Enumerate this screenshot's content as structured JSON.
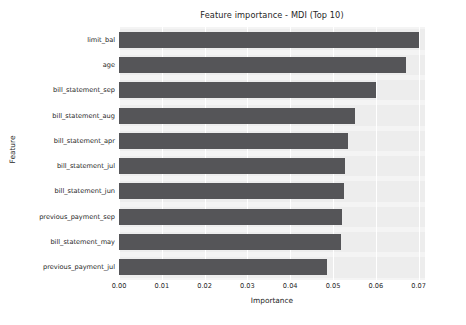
{
  "chart_data": {
    "type": "bar",
    "orientation": "horizontal",
    "title": "Feature importance - MDI (Top 10)",
    "xlabel": "Importance",
    "ylabel": "Feature",
    "categories": [
      "limit_bal",
      "age",
      "bill_statement_sep",
      "bill_statement_aug",
      "bill_statement_apr",
      "bill_statement_jul",
      "bill_statement_jun",
      "previous_payment_sep",
      "bill_statement_may",
      "previous_payment_jul"
    ],
    "values": [
      0.07,
      0.067,
      0.0601,
      0.0551,
      0.0535,
      0.0528,
      0.0526,
      0.0522,
      0.0519,
      0.0485
    ],
    "xlim": [
      0.0,
      0.0715
    ],
    "xticks": [
      0.0,
      0.01,
      0.02,
      0.03,
      0.04,
      0.05,
      0.06,
      0.07
    ],
    "xtick_labels": [
      "0.00",
      "0.01",
      "0.02",
      "0.03",
      "0.04",
      "0.05",
      "0.06",
      "0.07"
    ],
    "grid": true,
    "grid_axis": "x",
    "legend": false,
    "bar_color": "#555558",
    "plot_background": "#f4f4f4",
    "gridline_color": "#ffffff",
    "figure_background": "#ffffff"
  }
}
